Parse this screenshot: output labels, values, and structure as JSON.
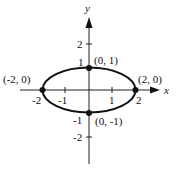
{
  "axes": {
    "x_label": "x",
    "y_label": "y",
    "x_ticks": [
      "-2",
      "-1",
      "1",
      "2"
    ],
    "y_ticks": [
      "2",
      "1",
      "-1",
      "-2"
    ]
  },
  "curve": {
    "type": "ellipse",
    "equation_implied": "x^2/4 + y^2 = 1",
    "color": "#111111"
  },
  "points": [
    {
      "label": "(0, 1)",
      "x": 0,
      "y": 1
    },
    {
      "label": "(-2, 0)",
      "x": -2,
      "y": 0
    },
    {
      "label": "(2, 0)",
      "x": 2,
      "y": 0
    },
    {
      "label": "(0, -1)",
      "x": 0,
      "y": -1
    }
  ]
}
